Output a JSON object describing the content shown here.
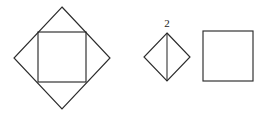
{
  "figure": {
    "background_color": "#ffffff",
    "stroke_color": "#2b2b2b",
    "label_color": "#1c1c1c",
    "canvas": {
      "width": 271,
      "height": 114
    },
    "shapes": [
      {
        "id": "large-diamond",
        "name": "large-diamond",
        "type": "diamond",
        "center": {
          "x": 62,
          "y": 58
        },
        "half_width": 48,
        "half_height": 51,
        "points": "62,7 110,58 62,109 14,58"
      },
      {
        "id": "inscribed-square",
        "name": "inscribed-square",
        "type": "square",
        "x": 38,
        "y": 32,
        "width": 48,
        "height": 50
      },
      {
        "id": "small-diamond",
        "name": "small-diamond",
        "type": "diamond",
        "center": {
          "x": 167,
          "y": 57
        },
        "half_width": 23,
        "half_height": 24,
        "points": "167,33 190,57 167,81 144,57"
      },
      {
        "id": "small-diamond-bisector",
        "name": "small-diamond-bisector",
        "type": "line",
        "x1": 167,
        "y1": 33,
        "x2": 167,
        "y2": 81
      },
      {
        "id": "right-square",
        "name": "right-square",
        "type": "square",
        "x": 203,
        "y": 31,
        "width": 50,
        "height": 50
      }
    ],
    "labels": [
      {
        "id": "label-2",
        "name": "dimension-label-2",
        "text": "2",
        "x": 167,
        "y": 27,
        "font_size": 11
      }
    ]
  }
}
